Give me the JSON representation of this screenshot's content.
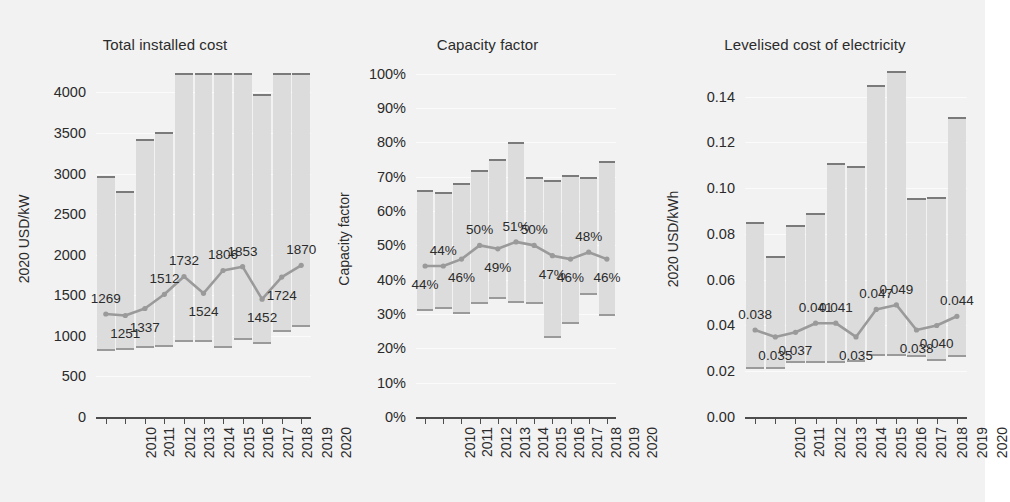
{
  "figure": {
    "background_color": "#f2f2f2",
    "bar_fill_color": "#dcdcdc",
    "line_color": "#9a9a9a",
    "text_color": "#2b2b2b"
  },
  "panels": [
    {
      "key": "total_installed_cost",
      "title": "Total installed cost",
      "ylabel": "2020 USD/kW"
    },
    {
      "key": "capacity_factor",
      "title": "Capacity factor",
      "ylabel": "Capacity factor"
    },
    {
      "key": "lcoe",
      "title": "Levelised cost of electricity",
      "ylabel": "2020 USD/kWh"
    }
  ],
  "chart_data": [
    {
      "type": "bar",
      "title": "Total installed cost",
      "xlabel": "",
      "ylabel": "2020 USD/kW",
      "ylim": [
        0,
        4400
      ],
      "yticks": [
        0,
        500,
        1000,
        1500,
        2000,
        2500,
        3000,
        3500,
        4000
      ],
      "ytick_labels": [
        "0",
        "500",
        "1000",
        "1500",
        "2000",
        "2500",
        "3000",
        "3500",
        "4000"
      ],
      "grid": true,
      "legend": "none",
      "categories": [
        "2010",
        "2011",
        "2012",
        "2013",
        "2014",
        "2015",
        "2016",
        "2017",
        "2018",
        "2019",
        "2020"
      ],
      "series": [
        {
          "name": "range_low",
          "values": [
            810,
            825,
            845,
            860,
            925,
            930,
            845,
            955,
            905,
            1045,
            1115
          ]
        },
        {
          "name": "range_high",
          "values": [
            2965,
            2780,
            3425,
            3510,
            4240,
            4240,
            4240,
            4240,
            3985,
            4240,
            4240
          ]
        },
        {
          "name": "weighted_average",
          "values": [
            1269,
            1251,
            1337,
            1512,
            1732,
            1524,
            1806,
            1853,
            1452,
            1724,
            1870
          ],
          "labels": [
            "1269",
            "1251",
            "1337",
            "1512",
            "1732",
            "1524",
            "1806",
            "1853",
            "1452",
            "1724",
            "1870"
          ],
          "label_positions": [
            "above",
            "below",
            "below",
            "above",
            "above",
            "below",
            "above",
            "above",
            "below",
            "below",
            "above"
          ]
        }
      ]
    },
    {
      "type": "bar",
      "title": "Capacity factor",
      "xlabel": "",
      "ylabel": "Capacity factor",
      "ylim": [
        0,
        1.04
      ],
      "yticks": [
        0,
        0.1,
        0.2,
        0.3,
        0.4,
        0.5,
        0.6,
        0.7,
        0.8,
        0.9,
        1.0
      ],
      "ytick_labels": [
        "0%",
        "10%",
        "20%",
        "30%",
        "40%",
        "50%",
        "60%",
        "70%",
        "80%",
        "90%",
        "100%"
      ],
      "grid": true,
      "legend": "none",
      "categories": [
        "2010",
        "2011",
        "2012",
        "2013",
        "2014",
        "2015",
        "2016",
        "2017",
        "2018",
        "2019",
        "2020"
      ],
      "series": [
        {
          "name": "range_low",
          "values": [
            0.31,
            0.315,
            0.3,
            0.33,
            0.345,
            0.332,
            0.33,
            0.23,
            0.27,
            0.355,
            0.295
          ]
        },
        {
          "name": "range_high",
          "values": [
            0.662,
            0.655,
            0.683,
            0.72,
            0.752,
            0.8,
            0.7,
            0.69,
            0.705,
            0.7,
            0.745
          ]
        },
        {
          "name": "weighted_average",
          "values": [
            0.44,
            0.44,
            0.46,
            0.5,
            0.49,
            0.51,
            0.5,
            0.47,
            0.46,
            0.48,
            0.46
          ],
          "labels": [
            "44%",
            "44%",
            "46%",
            "50%",
            "49%",
            "51%",
            "50%",
            "47%",
            "46%",
            "48%",
            "46%"
          ],
          "label_positions": [
            "below",
            "above",
            "below",
            "above",
            "below",
            "above",
            "above",
            "below",
            "below",
            "above",
            "below"
          ]
        }
      ]
    },
    {
      "type": "bar",
      "title": "Levelised cost of electricity",
      "xlabel": "",
      "ylabel": "2020 USD/kWh",
      "ylim": [
        0,
        0.156
      ],
      "yticks": [
        0,
        0.02,
        0.04,
        0.06,
        0.08,
        0.1,
        0.12,
        0.14
      ],
      "ytick_labels": [
        "0.00",
        "0.02",
        "0.04",
        "0.06",
        "0.08",
        "0.10",
        "0.12",
        "0.14"
      ],
      "grid": true,
      "legend": "none",
      "categories": [
        "2010",
        "2011",
        "2012",
        "2013",
        "2014",
        "2015",
        "2016",
        "2017",
        "2018",
        "2019",
        "2020"
      ],
      "series": [
        {
          "name": "range_low",
          "values": [
            0.021,
            0.021,
            0.0234,
            0.0236,
            0.0238,
            0.024,
            0.0266,
            0.0268,
            0.0262,
            0.0246,
            0.0262
          ]
        },
        {
          "name": "range_high",
          "values": [
            0.085,
            0.0705,
            0.084,
            0.089,
            0.1112,
            0.1098,
            0.145,
            0.151,
            0.0958,
            0.0962,
            0.131
          ]
        },
        {
          "name": "weighted_average",
          "values": [
            0.038,
            0.035,
            0.037,
            0.041,
            0.041,
            0.035,
            0.047,
            0.049,
            0.038,
            0.04,
            0.044
          ],
          "labels": [
            "0.038",
            "0.035",
            "0.037",
            "0.041",
            "0.041",
            "0.035",
            "0.047",
            "0.049",
            "0.038",
            "0.040",
            "0.044"
          ],
          "label_positions": [
            "above",
            "below",
            "below",
            "above",
            "above",
            "below",
            "above",
            "above",
            "below",
            "below",
            "above"
          ]
        }
      ]
    }
  ]
}
